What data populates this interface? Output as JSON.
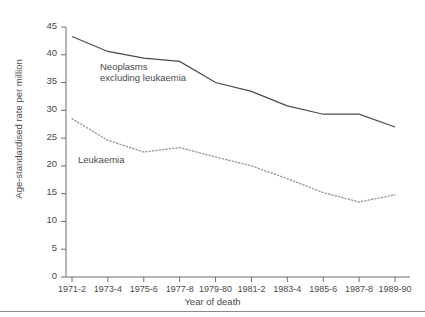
{
  "chart_data": {
    "type": "line",
    "title": "",
    "xlabel": "Year of death",
    "ylabel": "Age-standardised rate per million",
    "categories": [
      "1971-2",
      "1973-4",
      "1975-6",
      "1977-8",
      "1979-80",
      "1981-2",
      "1983-4",
      "1985-6",
      "1987-8",
      "1989-90"
    ],
    "ylim": [
      0,
      45
    ],
    "yticks": [
      0,
      5,
      10,
      15,
      20,
      25,
      30,
      35,
      40,
      45
    ],
    "grid": false,
    "legend_position": "inline-annotation",
    "series": [
      {
        "name": "Neoplasms excluding leukaemia",
        "style": "solid",
        "color": "#4a4a4a",
        "values": [
          43.3,
          40.6,
          39.4,
          38.8,
          35.0,
          33.4,
          30.8,
          29.3,
          29.3,
          27.0
        ]
      },
      {
        "name": "Leukaemia",
        "style": "dotted",
        "color": "#8c8c8c",
        "values": [
          28.5,
          24.6,
          22.5,
          23.3,
          21.6,
          20.0,
          17.7,
          15.2,
          13.5,
          14.8
        ]
      }
    ],
    "annotations": [
      {
        "id": "neoplasms",
        "line1": "Neoplasms",
        "line2": "excluding leukaemia"
      },
      {
        "id": "leukaemia",
        "line1": "Leukaemia",
        "line2": ""
      }
    ]
  },
  "ytick_labels": [
    "45",
    "40",
    "35",
    "30",
    "25",
    "20",
    "15",
    "10",
    "5",
    "0"
  ],
  "xtick_labels": [
    "1971-2",
    "1973-4",
    "1975-6",
    "1977-8",
    "1979-80",
    "1981-2",
    "1983-4",
    "1985-6",
    "1987-8",
    "1989-90"
  ],
  "axis": {
    "x_title": "Year of death",
    "y_title": "Age-standardised rate per million"
  },
  "series_labels": {
    "neoplasms_line1": "Neoplasms",
    "neoplasms_line2": "excluding leukaemia",
    "leukaemia": "Leukaemia"
  },
  "colors": {
    "axis": "#6e6e6e",
    "solid_series": "#4a4a4a",
    "dotted_series": "#9a9a9a",
    "text": "#4a4a4a",
    "rule": "#8a8a8a",
    "background": "#ffffff"
  }
}
